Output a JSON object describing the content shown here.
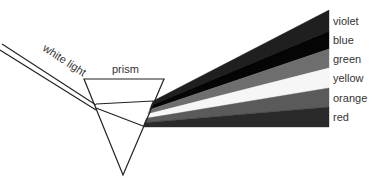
{
  "diagram": {
    "type": "prism-dispersion",
    "incoming": {
      "label": "white light",
      "line_color": "#222222",
      "lines": [
        {
          "x1": 2,
          "y1": 44,
          "x2": 96,
          "y2": 105
        },
        {
          "x1": 0,
          "y1": 50,
          "x2": 96,
          "y2": 110
        }
      ],
      "label_pos": {
        "x": 42,
        "y": 50,
        "rotate": 33
      }
    },
    "prism": {
      "label": "prism",
      "label_pos": {
        "x": 112,
        "y": 73
      },
      "vertices": [
        [
          84,
          79
        ],
        [
          164,
          79
        ],
        [
          123,
          175
        ]
      ],
      "stroke": "#222222",
      "internal_rays": [
        {
          "x1": 96,
          "y1": 104,
          "x2": 153,
          "y2": 101
        },
        {
          "x1": 96,
          "y1": 108,
          "x2": 143,
          "y2": 126
        }
      ]
    },
    "spectrum": {
      "source_top": [
        153,
        101
      ],
      "source_bottom": [
        143,
        127
      ],
      "end_x": 329,
      "end_top": 10,
      "end_bottom": 127,
      "bands": [
        {
          "label": "violet",
          "color": "#1f1f1f",
          "end_y0": 10,
          "end_y1": 31
        },
        {
          "label": "blue",
          "color": "#050505",
          "end_y0": 31,
          "end_y1": 49
        },
        {
          "label": "green",
          "color": "#6e6e6e",
          "end_y0": 49,
          "end_y1": 68
        },
        {
          "label": "yellow",
          "color": "#f6f6f6",
          "end_y0": 68,
          "end_y1": 88
        },
        {
          "label": "orange",
          "color": "#5a5a5a",
          "end_y0": 88,
          "end_y1": 107
        },
        {
          "label": "red",
          "color": "#2a2a2a",
          "end_y0": 107,
          "end_y1": 127
        }
      ],
      "label_x": 333
    }
  }
}
